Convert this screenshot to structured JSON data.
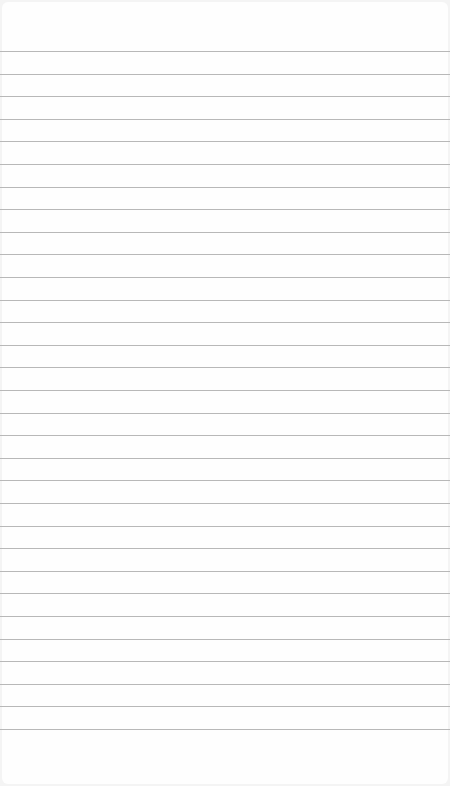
{
  "page": {
    "type": "lined-paper",
    "background": "#fefefe",
    "line_color": "#b8b8b8",
    "first_line_y": 51,
    "line_spacing": 22.6,
    "line_count": 31
  }
}
